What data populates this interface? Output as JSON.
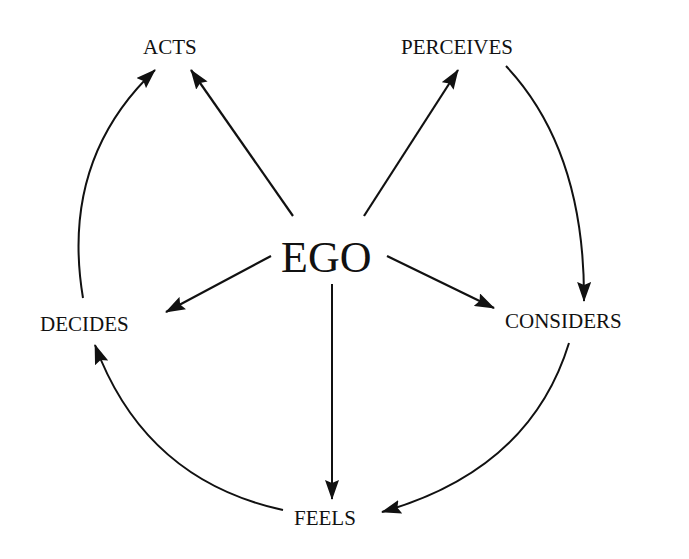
{
  "diagram": {
    "type": "cycle-with-hub",
    "center": {
      "label": "EGO"
    },
    "nodes": [
      {
        "id": "acts",
        "label": "ACTS"
      },
      {
        "id": "perceives",
        "label": "PERCEIVES"
      },
      {
        "id": "considers",
        "label": "CONSIDERS"
      },
      {
        "id": "feels",
        "label": "FEELS"
      },
      {
        "id": "decides",
        "label": "DECIDES"
      }
    ],
    "hub_edges": [
      {
        "from": "EGO",
        "to": "ACTS"
      },
      {
        "from": "EGO",
        "to": "PERCEIVES"
      },
      {
        "from": "EGO",
        "to": "CONSIDERS"
      },
      {
        "from": "EGO",
        "to": "FEELS"
      },
      {
        "from": "EGO",
        "to": "DECIDES"
      }
    ],
    "cycle_edges": [
      {
        "from": "PERCEIVES",
        "to": "CONSIDERS"
      },
      {
        "from": "CONSIDERS",
        "to": "FEELS"
      },
      {
        "from": "FEELS",
        "to": "DECIDES"
      },
      {
        "from": "DECIDES",
        "to": "ACTS"
      }
    ],
    "colors": {
      "line": "#111111",
      "background": "#ffffff"
    }
  }
}
